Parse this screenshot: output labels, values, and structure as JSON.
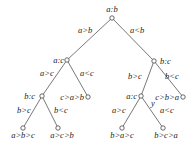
{
  "diagram": {
    "type": "decision-tree",
    "nodes": [
      {
        "id": "root",
        "label": "a:b",
        "x": 112,
        "y": 18,
        "label_x": 112,
        "label_y": 12,
        "anchor": "middle"
      },
      {
        "id": "ac1",
        "label": "a:c",
        "x": 67,
        "y": 60,
        "label_x": 64,
        "label_y": 63,
        "anchor": "end"
      },
      {
        "id": "bc1",
        "label": "b:c",
        "x": 154,
        "y": 61,
        "label_x": 160,
        "label_y": 64,
        "anchor": "start"
      },
      {
        "id": "bc2",
        "label": "b:c",
        "x": 42,
        "y": 96,
        "label_x": 35,
        "label_y": 99,
        "anchor": "end"
      },
      {
        "id": "leaf_cab",
        "label": "c>a>b",
        "x": 88,
        "y": 97,
        "label_x": 84,
        "label_y": 100,
        "anchor": "end"
      },
      {
        "id": "ac2",
        "label": "a:c",
        "x": 141,
        "y": 96,
        "label_x": 137,
        "label_y": 99,
        "anchor": "end"
      },
      {
        "id": "leaf_cba",
        "label": "c>b>a",
        "x": 183,
        "y": 97,
        "label_x": 179,
        "label_y": 100,
        "anchor": "end"
      },
      {
        "id": "leaf_abc",
        "label": "a>b>c",
        "x": 23,
        "y": 128,
        "label_x": 23,
        "label_y": 138,
        "anchor": "middle"
      },
      {
        "id": "leaf_acb",
        "label": "a>c>b",
        "x": 58,
        "y": 128,
        "label_x": 62,
        "label_y": 138,
        "anchor": "middle"
      },
      {
        "id": "leaf_bac",
        "label": "b>a>c",
        "x": 122,
        "y": 128,
        "label_x": 122,
        "label_y": 138,
        "anchor": "middle"
      },
      {
        "id": "leaf_bca",
        "label": "b>c>a",
        "x": 163,
        "y": 128,
        "label_x": 166,
        "label_y": 138,
        "anchor": "middle"
      }
    ],
    "edges": [
      {
        "from": "root",
        "to": "ac1",
        "label": "a>b",
        "label_x": 78,
        "label_y": 33,
        "anchor": "start"
      },
      {
        "from": "root",
        "to": "bc1",
        "label": "a<b",
        "label_x": 130,
        "label_y": 33,
        "anchor": "start"
      },
      {
        "from": "ac1",
        "to": "bc2",
        "label": "a>c",
        "label_x": 40,
        "label_y": 76,
        "anchor": "start"
      },
      {
        "from": "ac1",
        "to": "leaf_cab",
        "label": "a<c",
        "label_x": 80,
        "label_y": 76,
        "anchor": "start"
      },
      {
        "from": "bc1",
        "to": "ac2",
        "label": "b>c",
        "label_x": 128,
        "label_y": 79,
        "anchor": "start"
      },
      {
        "from": "bc1",
        "to": "leaf_cba",
        "label": "b<c",
        "label_x": 165,
        "label_y": 79,
        "anchor": "start"
      },
      {
        "from": "bc2",
        "to": "leaf_abc",
        "label": "b>c",
        "label_x": 17,
        "label_y": 113,
        "anchor": "start"
      },
      {
        "from": "bc2",
        "to": "leaf_acb",
        "label": "b<c",
        "label_x": 54,
        "label_y": 113,
        "anchor": "start"
      },
      {
        "from": "ac2",
        "to": "leaf_bac",
        "label": "a>c",
        "label_x": 112,
        "label_y": 113,
        "anchor": "start"
      },
      {
        "from": "ac2",
        "to": "leaf_bca",
        "label": "a<c",
        "label_x": 160,
        "label_y": 113,
        "anchor": "start"
      }
    ],
    "annotations": [
      {
        "text": "y",
        "x": 151,
        "y": 106
      }
    ]
  }
}
